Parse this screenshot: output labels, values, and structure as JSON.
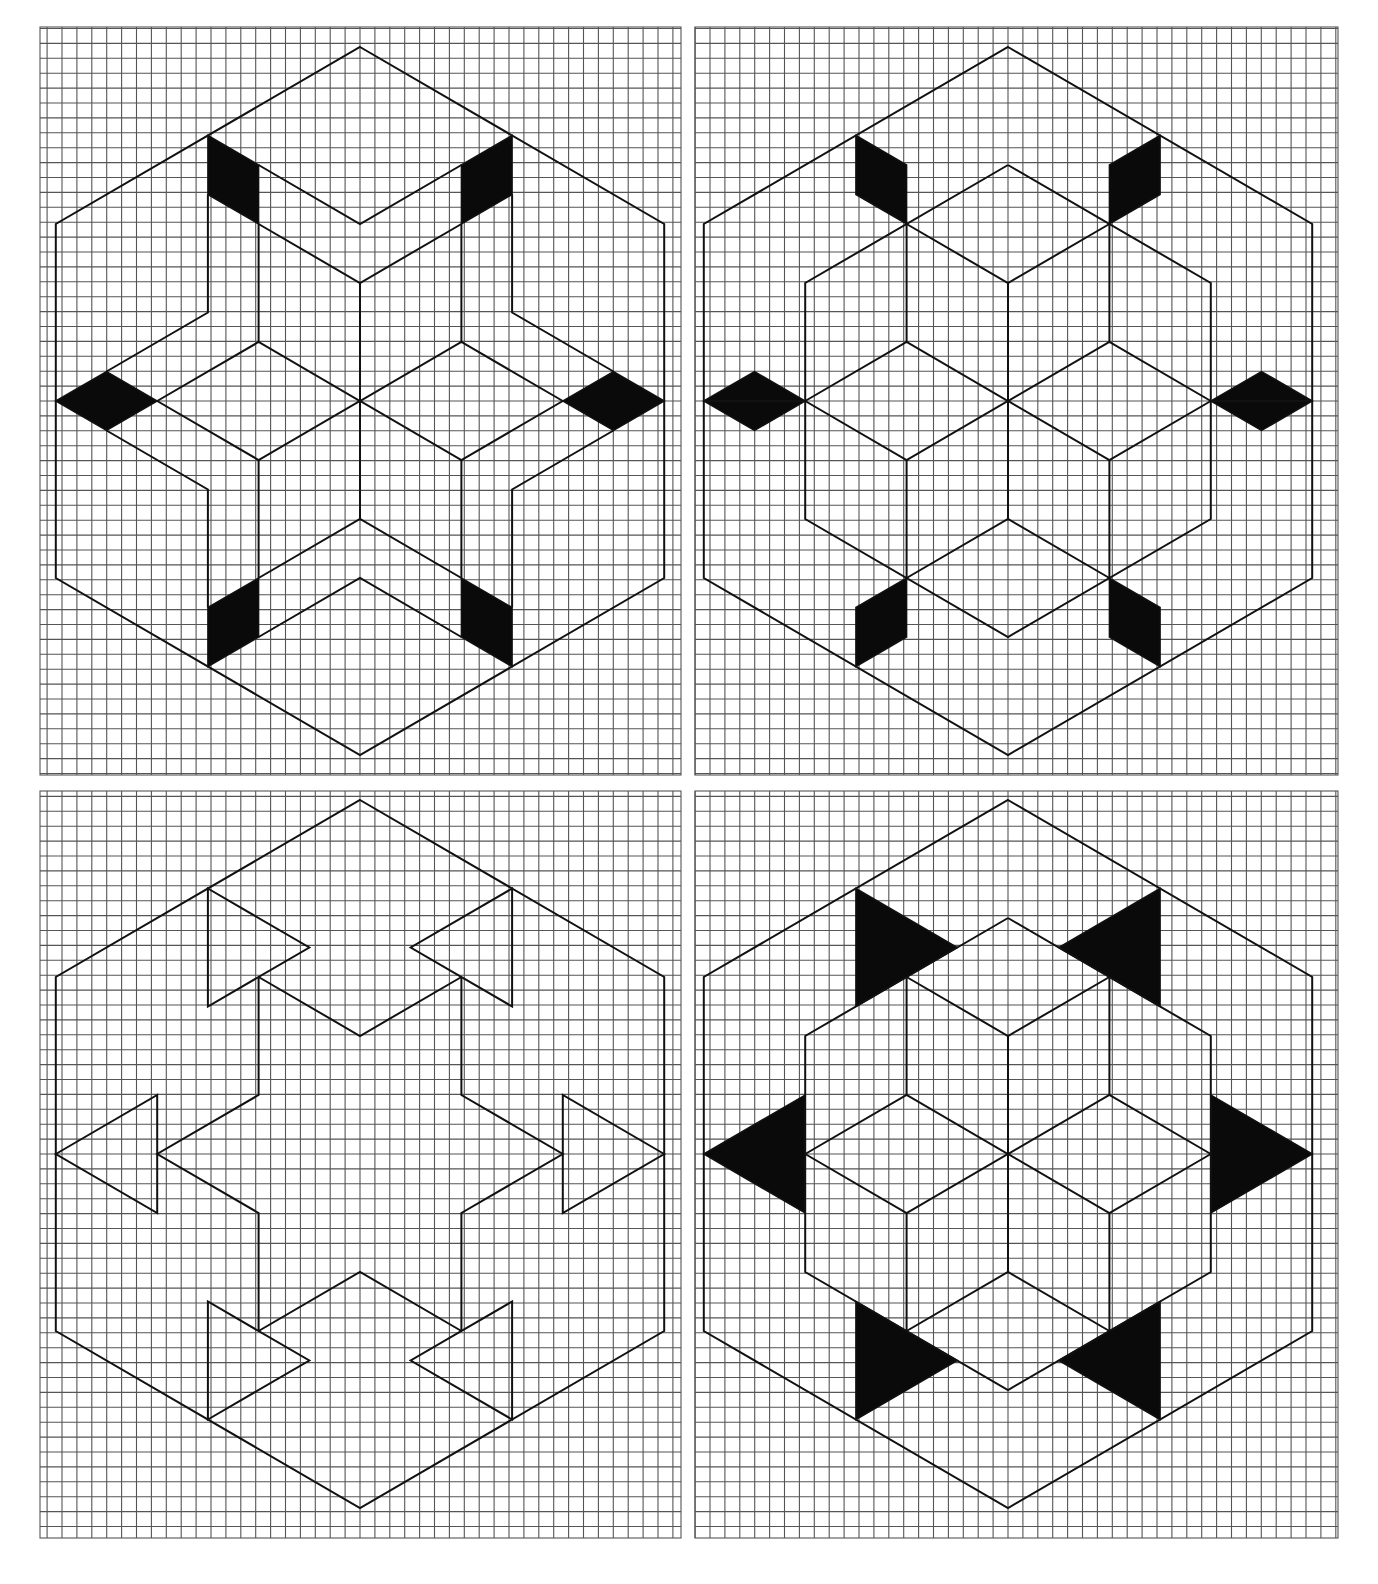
{
  "figure": {
    "title": "",
    "layout": "2x2 grid of isometric hexagon designs on square graph paper",
    "colors": {
      "background": "#ffffff",
      "grid": "#555555",
      "line": "#111111",
      "fill": "#0a0a0a"
    },
    "lattice": {
      "a": 50.7,
      "h": 29.5,
      "note": "point (i,j) maps to x = cx + i*a, y = cy + j*h"
    },
    "grid_cell_px": 14.9
  },
  "panels": [
    {
      "id": "top-left",
      "name": "hexagon-panel-top-left",
      "rect": [
        40,
        27,
        641,
        748
      ],
      "center": [
        360,
        401
      ],
      "lines": [
        [
          [
            -2,
            -8
          ],
          [
            0,
            -6
          ],
          [
            2,
            -8
          ]
        ],
        [
          [
            -2,
            -6
          ],
          [
            0,
            -4
          ],
          [
            2,
            -6
          ]
        ],
        [
          [
            -3,
            -7
          ],
          [
            -3,
            -3
          ],
          [
            -5,
            -1
          ]
        ],
        [
          [
            3,
            -7
          ],
          [
            3,
            -3
          ],
          [
            5,
            -1
          ]
        ],
        [
          [
            -2,
            -6
          ],
          [
            -2,
            -2
          ]
        ],
        [
          [
            2,
            -6
          ],
          [
            2,
            -2
          ]
        ],
        [
          [
            0,
            -4
          ],
          [
            0,
            4
          ]
        ],
        [
          [
            -4,
            0
          ],
          [
            -2,
            -2
          ],
          [
            0,
            0
          ],
          [
            2,
            -2
          ],
          [
            4,
            0
          ]
        ],
        [
          [
            -4,
            0
          ],
          [
            -2,
            2
          ],
          [
            0,
            0
          ],
          [
            2,
            2
          ],
          [
            4,
            0
          ]
        ],
        [
          [
            -5,
            1
          ],
          [
            -3,
            3
          ],
          [
            -3,
            7
          ]
        ],
        [
          [
            5,
            1
          ],
          [
            3,
            3
          ],
          [
            3,
            7
          ]
        ],
        [
          [
            -2,
            2
          ],
          [
            -2,
            6
          ]
        ],
        [
          [
            2,
            2
          ],
          [
            2,
            6
          ]
        ],
        [
          [
            -2,
            6
          ],
          [
            0,
            4
          ],
          [
            2,
            6
          ]
        ],
        [
          [
            -2,
            8
          ],
          [
            0,
            6
          ],
          [
            2,
            8
          ]
        ]
      ],
      "fills": [
        [
          [
            -3,
            -9
          ],
          [
            -2,
            -8
          ],
          [
            -2,
            -6
          ],
          [
            -3,
            -7
          ]
        ],
        [
          [
            3,
            -9
          ],
          [
            2,
            -8
          ],
          [
            2,
            -6
          ],
          [
            3,
            -7
          ]
        ],
        [
          [
            -6,
            0
          ],
          [
            -5,
            -1
          ],
          [
            -4,
            0
          ],
          [
            -5,
            1
          ]
        ],
        [
          [
            6,
            0
          ],
          [
            5,
            -1
          ],
          [
            4,
            0
          ],
          [
            5,
            1
          ]
        ],
        [
          [
            -3,
            9
          ],
          [
            -2,
            8
          ],
          [
            -2,
            6
          ],
          [
            -3,
            7
          ]
        ],
        [
          [
            3,
            9
          ],
          [
            2,
            8
          ],
          [
            2,
            6
          ],
          [
            3,
            7
          ]
        ]
      ],
      "outlines": []
    },
    {
      "id": "top-right",
      "name": "hexagon-panel-top-right",
      "rect": [
        695,
        27,
        643,
        748
      ],
      "center": [
        1008,
        401
      ],
      "lines": [
        [
          [
            0,
            -8
          ],
          [
            4,
            -4
          ],
          [
            4,
            4
          ],
          [
            0,
            8
          ],
          [
            -4,
            4
          ],
          [
            -4,
            -4
          ],
          [
            0,
            -8
          ]
        ],
        [
          [
            -2,
            -6
          ],
          [
            0,
            -4
          ],
          [
            2,
            -6
          ]
        ],
        [
          [
            -2,
            -6
          ],
          [
            -2,
            -2
          ]
        ],
        [
          [
            2,
            -6
          ],
          [
            2,
            -2
          ]
        ],
        [
          [
            0,
            -4
          ],
          [
            0,
            4
          ]
        ],
        [
          [
            -4,
            0
          ],
          [
            -2,
            -2
          ],
          [
            0,
            0
          ],
          [
            2,
            -2
          ],
          [
            4,
            0
          ]
        ],
        [
          [
            -4,
            0
          ],
          [
            -2,
            2
          ],
          [
            0,
            0
          ],
          [
            2,
            2
          ],
          [
            4,
            0
          ]
        ],
        [
          [
            -2,
            2
          ],
          [
            -2,
            6
          ]
        ],
        [
          [
            2,
            2
          ],
          [
            2,
            6
          ]
        ],
        [
          [
            -2,
            6
          ],
          [
            0,
            4
          ],
          [
            2,
            6
          ]
        ],
        [
          [
            -6,
            0
          ],
          [
            -4,
            0
          ]
        ],
        [
          [
            6,
            0
          ],
          [
            4,
            0
          ]
        ]
      ],
      "fills": [
        [
          [
            -3,
            -9
          ],
          [
            -2,
            -8
          ],
          [
            -2,
            -6
          ],
          [
            -3,
            -7
          ]
        ],
        [
          [
            3,
            -9
          ],
          [
            2,
            -8
          ],
          [
            2,
            -6
          ],
          [
            3,
            -7
          ]
        ],
        [
          [
            -6,
            0
          ],
          [
            -5,
            -1
          ],
          [
            -4,
            0
          ],
          [
            -5,
            1
          ]
        ],
        [
          [
            6,
            0
          ],
          [
            5,
            -1
          ],
          [
            4,
            0
          ],
          [
            5,
            1
          ]
        ],
        [
          [
            -3,
            9
          ],
          [
            -2,
            8
          ],
          [
            -2,
            6
          ],
          [
            -3,
            7
          ]
        ],
        [
          [
            3,
            9
          ],
          [
            2,
            8
          ],
          [
            2,
            6
          ],
          [
            3,
            7
          ]
        ]
      ],
      "outlines": []
    },
    {
      "id": "bottom-left",
      "name": "hexagon-panel-bottom-left",
      "rect": [
        40,
        791,
        641,
        747
      ],
      "center": [
        360,
        1154
      ],
      "lines": [
        [
          [
            -2,
            -6
          ],
          [
            0,
            -4
          ],
          [
            2,
            -6
          ]
        ],
        [
          [
            -2,
            -6
          ],
          [
            -2,
            -2
          ],
          [
            -4,
            0
          ],
          [
            -2,
            2
          ],
          [
            -2,
            6
          ]
        ],
        [
          [
            2,
            -6
          ],
          [
            2,
            -2
          ],
          [
            4,
            0
          ],
          [
            2,
            2
          ],
          [
            2,
            6
          ]
        ],
        [
          [
            -2,
            6
          ],
          [
            0,
            4
          ],
          [
            2,
            6
          ]
        ]
      ],
      "fills": [],
      "outlines": [
        [
          [
            -3,
            -9
          ],
          [
            -1,
            -7
          ],
          [
            -3,
            -5
          ]
        ],
        [
          [
            3,
            -9
          ],
          [
            1,
            -7
          ],
          [
            3,
            -5
          ]
        ],
        [
          [
            -6,
            0
          ],
          [
            -4,
            -2
          ],
          [
            -4,
            2
          ]
        ],
        [
          [
            6,
            0
          ],
          [
            4,
            -2
          ],
          [
            4,
            2
          ]
        ],
        [
          [
            -3,
            9
          ],
          [
            -1,
            7
          ],
          [
            -3,
            5
          ]
        ],
        [
          [
            3,
            9
          ],
          [
            1,
            7
          ],
          [
            3,
            5
          ]
        ]
      ]
    },
    {
      "id": "bottom-right",
      "name": "hexagon-panel-bottom-right",
      "rect": [
        695,
        791,
        643,
        747
      ],
      "center": [
        1008,
        1154
      ],
      "lines": [
        [
          [
            0,
            -8
          ],
          [
            4,
            -4
          ],
          [
            4,
            4
          ],
          [
            0,
            8
          ],
          [
            -4,
            4
          ],
          [
            -4,
            -4
          ],
          [
            0,
            -8
          ]
        ],
        [
          [
            -2,
            -6
          ],
          [
            0,
            -4
          ],
          [
            2,
            -6
          ]
        ],
        [
          [
            -2,
            -6
          ],
          [
            -2,
            -2
          ]
        ],
        [
          [
            2,
            -6
          ],
          [
            2,
            -2
          ]
        ],
        [
          [
            0,
            -4
          ],
          [
            0,
            4
          ]
        ],
        [
          [
            -4,
            0
          ],
          [
            -2,
            -2
          ],
          [
            0,
            0
          ],
          [
            2,
            -2
          ],
          [
            4,
            0
          ]
        ],
        [
          [
            -4,
            0
          ],
          [
            -2,
            2
          ],
          [
            0,
            0
          ],
          [
            2,
            2
          ],
          [
            4,
            0
          ]
        ],
        [
          [
            -2,
            2
          ],
          [
            -2,
            6
          ]
        ],
        [
          [
            2,
            2
          ],
          [
            2,
            6
          ]
        ],
        [
          [
            -2,
            6
          ],
          [
            0,
            4
          ],
          [
            2,
            6
          ]
        ]
      ],
      "fills": [
        [
          [
            -3,
            -9
          ],
          [
            -1,
            -7
          ],
          [
            -3,
            -5
          ]
        ],
        [
          [
            3,
            -9
          ],
          [
            1,
            -7
          ],
          [
            3,
            -5
          ]
        ],
        [
          [
            -6,
            0
          ],
          [
            -4,
            -2
          ],
          [
            -4,
            2
          ]
        ],
        [
          [
            6,
            0
          ],
          [
            4,
            -2
          ],
          [
            4,
            2
          ]
        ],
        [
          [
            -3,
            9
          ],
          [
            -1,
            7
          ],
          [
            -3,
            5
          ]
        ],
        [
          [
            3,
            9
          ],
          [
            1,
            7
          ],
          [
            3,
            5
          ]
        ]
      ],
      "outlines": []
    }
  ]
}
